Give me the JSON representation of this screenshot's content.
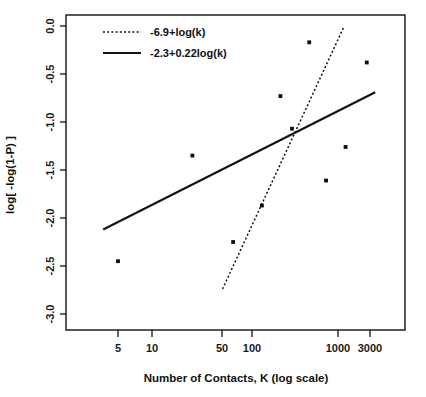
{
  "chart_data": {
    "type": "scatter",
    "title": "",
    "subtitle": "",
    "xlabel": "Number of Contacts, K (log scale)",
    "ylabel": "log[ -log(1-P) ]",
    "xscale": "log",
    "yscale": "linear",
    "grid": false,
    "xlim": [
      3,
      3400
    ],
    "ylim": [
      -3.15,
      0.12
    ],
    "xticks": [
      5,
      10,
      50,
      100,
      1000,
      3000
    ],
    "xtick_labels": [
      "5",
      "10",
      "50",
      "100",
      "1000",
      "3000"
    ],
    "yticks": [
      0.0,
      -0.5,
      -1.0,
      -1.5,
      -2.0,
      -2.5,
      -3.0
    ],
    "ytick_labels": [
      "0.0",
      "-0.5",
      "-1.0",
      "-1.5",
      "-2.0",
      "-2.5",
      "-3.0"
    ],
    "legend_position": "top-left",
    "points": [
      {
        "x": 5,
        "y": -2.45
      },
      {
        "x": 30,
        "y": -1.35
      },
      {
        "x": 80,
        "y": -2.25
      },
      {
        "x": 160,
        "y": -1.87
      },
      {
        "x": 250,
        "y": -0.73
      },
      {
        "x": 330,
        "y": -1.07
      },
      {
        "x": 500,
        "y": -0.17
      },
      {
        "x": 750,
        "y": -1.61
      },
      {
        "x": 1200,
        "y": -1.26
      },
      {
        "x": 2000,
        "y": -0.38
      }
    ],
    "series": [
      {
        "name": "-6.9+log(k)",
        "style": "dotted",
        "intercept": -6.9,
        "slope": 1.0,
        "base": "log10",
        "x_start": 62,
        "x_end": 1150,
        "y_start": -2.74,
        "y_end": -0.01,
        "color": "#111111"
      },
      {
        "name": "-2.3+0.22log(k)",
        "style": "solid",
        "intercept": -2.3,
        "slope": 0.22,
        "base": "log10",
        "x_start": 3.5,
        "x_end": 2450,
        "y_start": -2.12,
        "y_end": -0.69,
        "color": "#111111"
      }
    ]
  },
  "legend": {
    "entries": [
      {
        "label": "-6.9+log(k)",
        "style": "dotted"
      },
      {
        "label": "-2.3+0.22log(k)",
        "style": "solid"
      }
    ]
  }
}
